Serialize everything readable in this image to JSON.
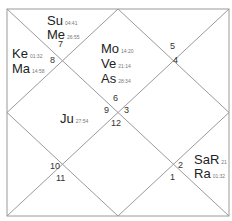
{
  "chart": {
    "style": "north-indian",
    "line_color": "#9a9a9a",
    "frame": {
      "x1": 7,
      "y1": 9,
      "x2": 229,
      "y2": 216
    }
  },
  "houses": [
    {
      "id": "h6",
      "label": "6"
    },
    {
      "id": "h9",
      "label": "9"
    },
    {
      "id": "h3",
      "label": "3"
    },
    {
      "id": "h12",
      "label": "12"
    },
    {
      "id": "h7",
      "label": "7"
    },
    {
      "id": "h8",
      "label": "8"
    },
    {
      "id": "h5",
      "label": "5"
    },
    {
      "id": "h4",
      "label": "4"
    },
    {
      "id": "h10",
      "label": "10"
    },
    {
      "id": "h11",
      "label": "11"
    },
    {
      "id": "h2",
      "label": "2"
    },
    {
      "id": "h1",
      "label": "1"
    }
  ],
  "planets": {
    "su": {
      "name": "Su",
      "degree": "04:41"
    },
    "me": {
      "name": "Me",
      "degree": "26:55"
    },
    "ke": {
      "name": "Ke",
      "degree": "01:32"
    },
    "ma": {
      "name": "Ma",
      "degree": "14:58"
    },
    "mo": {
      "name": "Mo",
      "degree": "14:20"
    },
    "ve": {
      "name": "Ve",
      "degree": "21:14"
    },
    "as": {
      "name": "As",
      "degree": "28:34"
    },
    "ju": {
      "name": "Ju",
      "degree": "27:54"
    },
    "sa": {
      "name": "SaR",
      "degree": "21"
    },
    "ra": {
      "name": "Ra",
      "degree": "01:32"
    }
  }
}
